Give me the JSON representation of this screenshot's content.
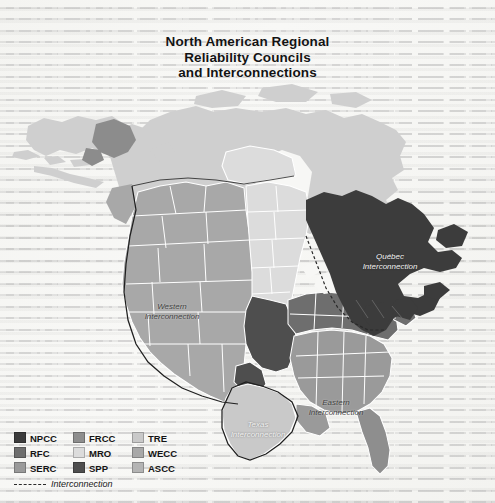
{
  "title": {
    "line1": "North American Regional",
    "line2": "Reliability Councils",
    "line3": "and Interconnections"
  },
  "map_labels": [
    {
      "name": "western-interconnection",
      "line1": "Western",
      "line2": "Interconnection",
      "tone": "dark"
    },
    {
      "name": "quebec-interconnection",
      "line1": "Québec",
      "line2": "Interconnection",
      "tone": "light"
    },
    {
      "name": "eastern-interconnection",
      "line1": "Eastern",
      "line2": "Interconnection",
      "tone": "dark"
    },
    {
      "name": "texas-interconnection",
      "line1": "Texas",
      "line2": "Interconnection",
      "tone": "light"
    }
  ],
  "legend": {
    "rows": [
      [
        {
          "label": "NPCC",
          "color": "#3c3c3c"
        },
        {
          "label": "FRCC",
          "color": "#8e8e8e"
        },
        {
          "label": "TRE",
          "color": "#c9c9c9"
        }
      ],
      [
        {
          "label": "RFC",
          "color": "#6e6e6e"
        },
        {
          "label": "MRO",
          "color": "#dcdcdc"
        },
        {
          "label": "WECC",
          "color": "#a8a8a8"
        }
      ],
      [
        {
          "label": "SERC",
          "color": "#9a9a9a"
        },
        {
          "label": "SPP",
          "color": "#4e4e4e"
        },
        {
          "label": "ASCC",
          "color": "#b4b4b4"
        }
      ]
    ],
    "interconnection_label": "Interconnection"
  },
  "colors": {
    "paper": "#f7f7f5",
    "npcc": "#3c3c3c",
    "rfc": "#6e6e6e",
    "serc": "#9a9a9a",
    "frcc": "#8e8e8e",
    "mro": "#dcdcdc",
    "spp": "#4e4e4e",
    "tre": "#c9c9c9",
    "wecc": "#a8a8a8",
    "ascc": "#b4b4b4",
    "canada_other": "#cfcfcf",
    "border_white": "#ffffff",
    "interconnection_dash": "#2a2a2a"
  },
  "map_regions": [
    {
      "name": "alaska-ascc",
      "council": "ASCC"
    },
    {
      "name": "canada-non-council",
      "council": "none"
    },
    {
      "name": "wecc-region",
      "council": "WECC"
    },
    {
      "name": "mro-region",
      "council": "MRO"
    },
    {
      "name": "spp-region",
      "council": "SPP"
    },
    {
      "name": "tre-region",
      "council": "TRE"
    },
    {
      "name": "serc-region",
      "council": "SERC"
    },
    {
      "name": "frcc-region",
      "council": "FRCC"
    },
    {
      "name": "rfc-region",
      "council": "RFC"
    },
    {
      "name": "npcc-region",
      "council": "NPCC"
    }
  ]
}
